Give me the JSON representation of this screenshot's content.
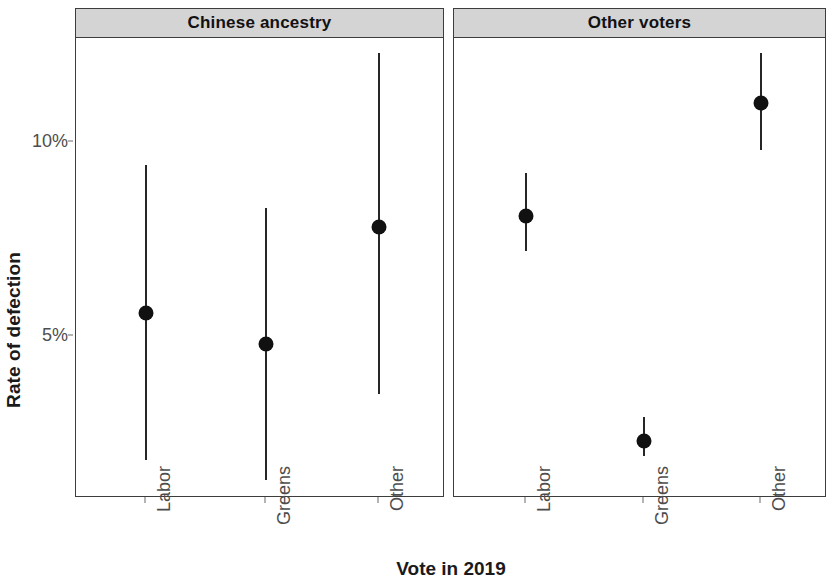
{
  "chart_data": {
    "type": "scatter",
    "title": "",
    "xlabel": "Vote in 2019",
    "ylabel": "Rate of defection",
    "categories": [
      "Labor",
      "Greens",
      "Other"
    ],
    "facets": [
      "Chinese ancestry",
      "Other voters"
    ],
    "y_tick_labels": [
      "10%",
      "5%"
    ],
    "y_tick_values": [
      10,
      5
    ],
    "ylim": [
      0.8,
      12.9
    ],
    "grid": false,
    "legend": null,
    "error_bar_type": "confidence interval",
    "panels": [
      {
        "facet": "Chinese ancestry",
        "points": [
          {
            "category": "Labor",
            "value": 5.6,
            "low": 1.8,
            "high": 9.4
          },
          {
            "category": "Greens",
            "value": 4.8,
            "low": 1.3,
            "high": 8.3
          },
          {
            "category": "Other",
            "value": 7.8,
            "low": 3.5,
            "high": 12.3
          }
        ]
      },
      {
        "facet": "Other voters",
        "points": [
          {
            "category": "Labor",
            "value": 8.1,
            "low": 7.2,
            "high": 9.2
          },
          {
            "category": "Greens",
            "value": 2.3,
            "low": 1.9,
            "high": 2.9
          },
          {
            "category": "Other",
            "value": 11.0,
            "low": 9.8,
            "high": 12.3
          }
        ]
      }
    ],
    "colors": {
      "point": "#111111",
      "errorbar": "#262626",
      "panel_strip": "#d4d4d4",
      "panel_border": "#3d3d3d",
      "axis_text": "#4d4d4d",
      "background": "#ffffff"
    }
  }
}
